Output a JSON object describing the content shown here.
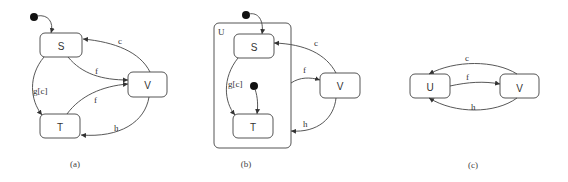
{
  "figure": {
    "panels": [
      {
        "caption": "(a)",
        "states": {
          "S": "S",
          "V": "V",
          "T": "T"
        },
        "transitions": {
          "c": "c",
          "f1": "f",
          "f2": "f",
          "g": "g[c]",
          "h": "h"
        }
      },
      {
        "caption": "(b)",
        "superstate": "U",
        "states": {
          "S": "S",
          "T": "T",
          "V": "V"
        },
        "transitions": {
          "c": "c",
          "f": "f",
          "g": "g[c]",
          "h": "h"
        }
      },
      {
        "caption": "(c)",
        "states": {
          "U": "U",
          "V": "V"
        },
        "transitions": {
          "c": "c",
          "f": "f",
          "h": "h"
        }
      }
    ]
  },
  "colors": {
    "stroke": "#555555",
    "initial": "#111111",
    "background": "#ffffff"
  }
}
